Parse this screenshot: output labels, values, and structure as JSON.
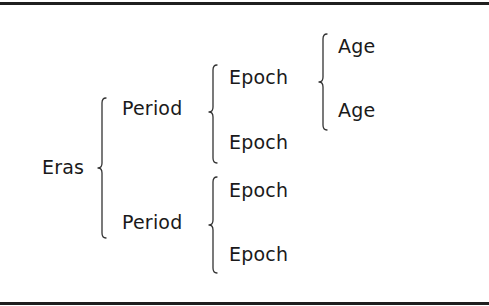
{
  "diagram": {
    "type": "hierarchy-brace",
    "root": {
      "label": "Eras",
      "children": [
        {
          "label": "Period",
          "children": [
            {
              "label": "Epoch",
              "children": [
                {
                  "label": "Age"
                },
                {
                  "label": "Age"
                }
              ]
            },
            {
              "label": "Epoch"
            }
          ]
        },
        {
          "label": "Period",
          "children": [
            {
              "label": "Epoch"
            },
            {
              "label": "Epoch"
            }
          ]
        }
      ]
    }
  },
  "labels": {
    "eras": "Eras",
    "period_1": "Period",
    "period_2": "Period",
    "epoch_1": "Epoch",
    "epoch_2": "Epoch",
    "epoch_3": "Epoch",
    "epoch_4": "Epoch",
    "age_1": "Age",
    "age_2": "Age"
  }
}
